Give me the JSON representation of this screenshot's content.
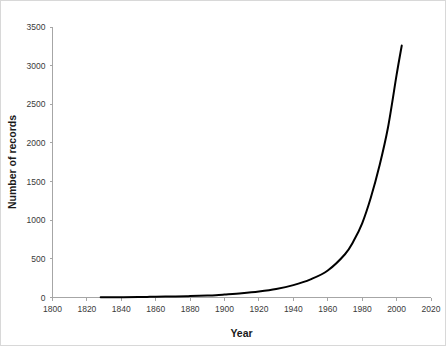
{
  "chart_data": {
    "type": "line",
    "title": "",
    "xlabel": "Year",
    "ylabel": "Number of records",
    "xlim": [
      1800,
      2020
    ],
    "ylim": [
      0,
      3500
    ],
    "xticks": [
      1800,
      1820,
      1840,
      1860,
      1880,
      1900,
      1920,
      1940,
      1960,
      1980,
      2000,
      2020
    ],
    "yticks": [
      0,
      500,
      1000,
      1500,
      2000,
      2500,
      3000,
      3500
    ],
    "grid": false,
    "legend": null,
    "line_color": "#000000",
    "axis_color": "#a6a6a6",
    "series": [
      {
        "name": "Number of records",
        "x": [
          1828,
          1840,
          1850,
          1855,
          1860,
          1870,
          1878,
          1880,
          1890,
          1895,
          1900,
          1910,
          1920,
          1930,
          1940,
          1950,
          1960,
          1970,
          1975,
          1980,
          1985,
          1990,
          1995,
          2000,
          2003
        ],
        "values": [
          2,
          4,
          6,
          8,
          10,
          13,
          17,
          18,
          25,
          30,
          38,
          55,
          78,
          110,
          160,
          235,
          350,
          560,
          730,
          960,
          1290,
          1700,
          2200,
          2880,
          3260
        ]
      }
    ]
  },
  "axis_titles": {
    "x": "Year",
    "y": "Number of records"
  }
}
